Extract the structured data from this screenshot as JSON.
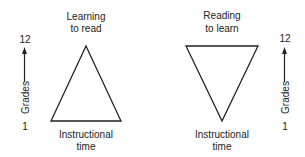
{
  "left_panel": {
    "title_line1": "Learning",
    "title_line2": "to read",
    "axis_top": "12",
    "axis_bottom": "1",
    "axis_label": "Grades",
    "base_line1": "Instructional",
    "base_line2": "time",
    "shape": "upward-triangle"
  },
  "right_panel": {
    "title_line1": "Reading",
    "title_line2": "to learn",
    "axis_top": "12",
    "axis_bottom": "1",
    "axis_label": "Grades",
    "base_line1": "Instructional",
    "base_line2": "time",
    "shape": "downward-triangle"
  },
  "colors": {
    "stroke": "#222222",
    "background": "#ffffff"
  }
}
